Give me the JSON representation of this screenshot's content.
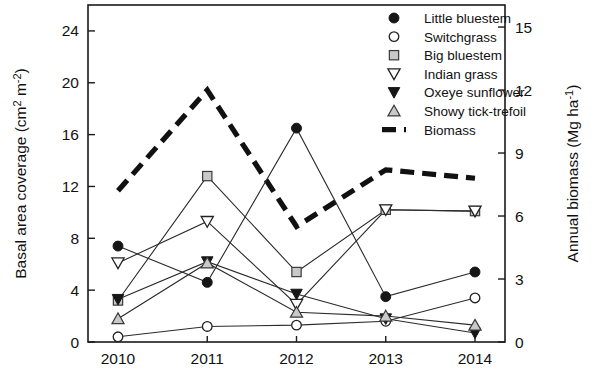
{
  "chart_data": {
    "type": "line",
    "title": "",
    "xlabel": "",
    "ylabel": "Basal area coverage (cm² m⁻²)",
    "y2label": "Annual biomass (Mg ha⁻¹)",
    "categories": [
      "2010",
      "2011",
      "2012",
      "2013",
      "2014"
    ],
    "x": [
      2010,
      2011,
      2012,
      2013,
      2014
    ],
    "ylim": [
      0,
      26
    ],
    "yticks": [
      0,
      4,
      8,
      12,
      16,
      20,
      24
    ],
    "y2lim": [
      0,
      16.05
    ],
    "y2ticks": [
      0,
      3,
      6,
      9,
      12,
      15
    ],
    "grid": false,
    "legend_position": "top-right",
    "series": [
      {
        "name": "Little bluestem",
        "marker": "filled-circle",
        "axis": "left",
        "values": [
          7.4,
          4.6,
          16.5,
          3.5,
          5.4
        ]
      },
      {
        "name": "Switchgrass",
        "marker": "open-circle",
        "axis": "left",
        "values": [
          0.4,
          1.2,
          1.3,
          1.6,
          3.4
        ]
      },
      {
        "name": "Big bluestem",
        "marker": "gray-square",
        "axis": "left",
        "values": [
          3.2,
          12.8,
          5.4,
          10.2,
          10.1
        ]
      },
      {
        "name": "Indian grass",
        "marker": "open-down-triangle",
        "axis": "left",
        "values": [
          6.1,
          9.3,
          2.9,
          10.2,
          10.1
        ]
      },
      {
        "name": "Oxeye sunflower",
        "marker": "filled-down-triangle",
        "axis": "left",
        "values": [
          3.3,
          6.2,
          3.7,
          1.8,
          0.7
        ]
      },
      {
        "name": "Showy tick-trefoil",
        "marker": "gray-up-triangle",
        "axis": "left",
        "values": [
          1.8,
          6.1,
          2.3,
          2.0,
          1.3
        ]
      },
      {
        "name": "Biomass",
        "marker": "dashed-line",
        "axis": "right",
        "values": [
          7.2,
          12.0,
          5.5,
          8.2,
          7.8
        ]
      }
    ]
  },
  "legend": {
    "items": [
      {
        "label": "Little bluestem",
        "marker": "filled-circle"
      },
      {
        "label": "Switchgrass",
        "marker": "open-circle"
      },
      {
        "label": "Big bluestem",
        "marker": "gray-square"
      },
      {
        "label": "Indian grass",
        "marker": "open-down-triangle"
      },
      {
        "label": "Oxeye sunflower",
        "marker": "filled-down-triangle"
      },
      {
        "label": "Showy tick-trefoil",
        "marker": "gray-up-triangle"
      },
      {
        "label": "Biomass",
        "marker": "dashed-line"
      }
    ]
  },
  "axes": {
    "left_title": "Basal area coverage (cm² m⁻²)",
    "right_title": "Annual biomass (Mg ha⁻¹)",
    "left_ticks": [
      "0",
      "4",
      "8",
      "12",
      "16",
      "20",
      "24"
    ],
    "right_ticks": [
      "0",
      "3",
      "6",
      "9",
      "12",
      "15"
    ],
    "x_ticks": [
      "2010",
      "2011",
      "2012",
      "2013",
      "2014"
    ]
  }
}
